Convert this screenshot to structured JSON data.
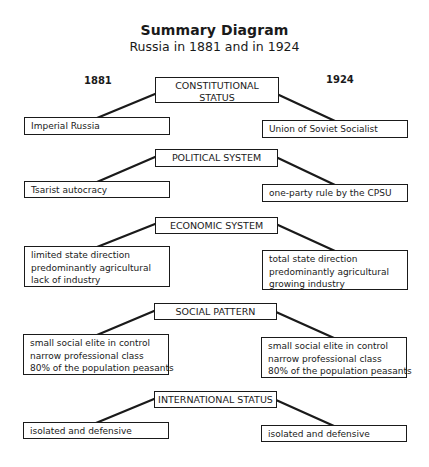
{
  "title": "Summary Diagram",
  "subtitle": "Russia in 1881 and in 1924",
  "years": {
    "left": "1881",
    "right": "1924"
  },
  "sections": [
    {
      "category": [
        "CONSTITUTIONAL",
        "STATUS"
      ],
      "left": [
        "Imperial Russia"
      ],
      "right": [
        "Union of Soviet Socialist"
      ]
    },
    {
      "category": [
        "POLITICAL SYSTEM"
      ],
      "left": [
        "Tsarist autocracy"
      ],
      "right": [
        "one-party rule by the CPSU"
      ]
    },
    {
      "category": [
        "ECONOMIC SYSTEM"
      ],
      "left": [
        "limited state direction",
        "predominantly agricultural",
        "lack of industry"
      ],
      "right": [
        "total state direction",
        "predominantly agricultural",
        "growing industry"
      ]
    },
    {
      "category": [
        "SOCIAL PATTERN"
      ],
      "left": [
        "small social elite in control",
        "narrow professional class",
        "80% of the population peasants"
      ],
      "right": [
        "small social elite in control",
        "narrow professional class",
        "80% of the population peasants"
      ]
    },
    {
      "category": [
        "INTERNATIONAL STATUS"
      ],
      "left": [
        "isolated and defensive"
      ],
      "right": [
        "isolated and defensive"
      ]
    }
  ]
}
